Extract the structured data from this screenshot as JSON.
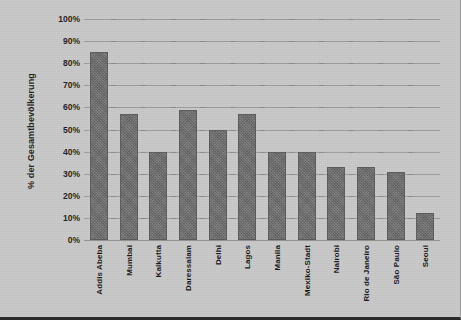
{
  "chart_data": {
    "type": "bar",
    "title": "",
    "subtitle": "",
    "xlabel": "",
    "ylabel": "% der Gesamtbevölkerung",
    "ylim": [
      0,
      100
    ],
    "ytick_labels": [
      "100%",
      "90%",
      "80%",
      "70%",
      "60%",
      "50%",
      "40%",
      "30%",
      "20%",
      "10%",
      "0%"
    ],
    "ytick_values": [
      100,
      90,
      80,
      70,
      60,
      50,
      40,
      30,
      20,
      10,
      0
    ],
    "grid": true,
    "legend": "none",
    "categories": [
      "Addis Abeba",
      "Mumbai",
      "Kalkutta",
      "Daressalam",
      "Delhi",
      "Lagos",
      "Manila",
      "Mexiko-Stadt",
      "Nairobi",
      "Rio de Janeiro",
      "São Paulo",
      "Seoul"
    ],
    "values": [
      85,
      57,
      40,
      59,
      50,
      57,
      40,
      40,
      33,
      33,
      31,
      12
    ],
    "bar_color": "#6c6c6c",
    "background_color": "#c9c9c9",
    "gridline_color": "#9d9d9d"
  }
}
